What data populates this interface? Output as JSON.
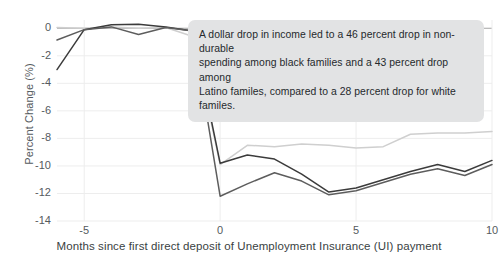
{
  "chart_data": {
    "type": "line",
    "title": "",
    "xlabel": "Months since first direct deposit of Unemployment Insurance (UI) payment",
    "ylabel": "Percent Change (%)",
    "xlim": [
      -6,
      10
    ],
    "ylim": [
      -14,
      0.6
    ],
    "xticks": [
      -5,
      0,
      5,
      10
    ],
    "xticklabels": [
      "-5",
      "0",
      "5",
      "10"
    ],
    "yticks": [
      0,
      -2,
      -4,
      -6,
      -8,
      -10,
      -12,
      -14
    ],
    "yticklabels": [
      "0",
      "-2",
      "-4",
      "-6",
      "-8",
      "-10",
      "-12",
      "-14"
    ],
    "grid": true,
    "legend": "none",
    "x": [
      -6,
      -5,
      -4,
      -3,
      -2,
      -1,
      0,
      1,
      2,
      3,
      4,
      5,
      6,
      7,
      8,
      9,
      10
    ],
    "series": [
      {
        "name": "Black families",
        "color": "#3b3b3b",
        "values": [
          -3.0,
          -0.1,
          0.25,
          0.3,
          0.1,
          -0.2,
          -9.8,
          -9.2,
          -9.5,
          -10.6,
          -11.9,
          -11.6,
          -11.0,
          -10.4,
          -9.9,
          -10.4,
          -9.6
        ]
      },
      {
        "name": "Latino families",
        "color": "#5d5d5d",
        "values": [
          -0.85,
          -0.1,
          0.1,
          -0.45,
          0.05,
          -0.2,
          -12.2,
          -11.3,
          -10.5,
          -11.1,
          -12.1,
          -11.8,
          -11.2,
          -10.6,
          -10.2,
          -10.7,
          -9.9
        ]
      },
      {
        "name": "White families",
        "color": "#cfcfcf",
        "values": [
          0.05,
          0.0,
          0.1,
          0.0,
          0.05,
          -0.6,
          -9.9,
          -8.5,
          -8.6,
          -8.4,
          -8.5,
          -8.7,
          -8.6,
          -7.7,
          -7.6,
          -7.6,
          -7.5
        ]
      }
    ],
    "annotations": [
      {
        "id": "callout",
        "lines": [
          "A dollar drop in income led to a 46 percent drop in non-durable",
          "spending among black families and a 43 percent drop among",
          "Latino familes, compared to a 28 percent drop for white familes."
        ]
      }
    ]
  }
}
